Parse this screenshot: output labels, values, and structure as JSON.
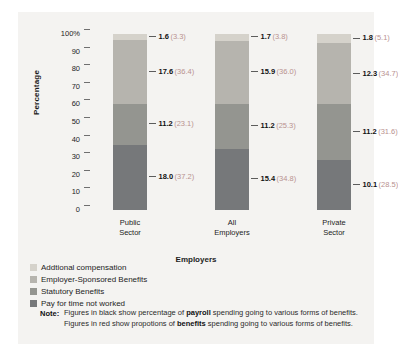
{
  "chart_data": {
    "type": "bar",
    "variant": "stacked-100",
    "title": "",
    "xlabel": "Employers",
    "ylabel": "Percentage",
    "ylim": [
      0,
      100
    ],
    "ytick_labels": [
      "100%",
      "90",
      "80",
      "70",
      "60",
      "50",
      "40",
      "30",
      "20",
      "10",
      "0"
    ],
    "ytick_values": [
      100,
      90,
      80,
      70,
      60,
      50,
      40,
      30,
      20,
      10,
      0
    ],
    "grid": false,
    "legend_position": "below-left",
    "categories": [
      "Public Sector",
      "All Employers",
      "Private Sector"
    ],
    "category_lines": [
      [
        "Public",
        "Sector"
      ],
      [
        "All",
        "Employers"
      ],
      [
        "Private",
        "Sector"
      ]
    ],
    "series": [
      {
        "name": "Addtional compensation",
        "color": "#d5d2cb",
        "values": [
          3.3,
          3.8,
          5.1
        ],
        "payroll_values": [
          1.6,
          1.7,
          1.8
        ]
      },
      {
        "name": "Employer-Sponsored Benefits",
        "color": "#b6b4ae",
        "values": [
          36.4,
          36.0,
          34.7
        ],
        "payroll_values": [
          17.6,
          15.9,
          12.3
        ]
      },
      {
        "name": "Statutory Benefits",
        "color": "#949590",
        "values": [
          23.1,
          25.3,
          31.6
        ],
        "payroll_values": [
          11.2,
          11.2,
          11.2
        ]
      },
      {
        "name": "Pay for time not worked",
        "color": "#76787a",
        "values": [
          37.2,
          34.8,
          28.5
        ],
        "payroll_values": [
          18.0,
          15.4,
          10.1
        ]
      }
    ],
    "bar_labels": [
      [
        {
          "black": "1.6",
          "red": "(3.3)"
        },
        {
          "black": "17.6",
          "red": "(36.4)"
        },
        {
          "black": "11.2",
          "red": "(23.1)"
        },
        {
          "black": "18.0",
          "red": "(37.2)"
        }
      ],
      [
        {
          "black": "1.7",
          "red": "(3.8)"
        },
        {
          "black": "15.9",
          "red": "(36.0)"
        },
        {
          "black": "11.2",
          "red": "(25.3)"
        },
        {
          "black": "15.4",
          "red": "(34.8)"
        }
      ],
      [
        {
          "black": "1.8",
          "red": "(5.1)"
        },
        {
          "black": "12.3",
          "red": "(34.7)"
        },
        {
          "black": "11.2",
          "red": "(31.6)"
        },
        {
          "black": "10.1",
          "red": "(28.5)"
        }
      ]
    ]
  },
  "legend": {
    "items": [
      {
        "label": "Addtional compensation",
        "color": "#d5d2cb"
      },
      {
        "label": "Employer-Sponsored Benefits",
        "color": "#b6b4ae"
      },
      {
        "label": "Statutory Benefits",
        "color": "#949590"
      },
      {
        "label": "Pay for time not worked",
        "color": "#76787a"
      }
    ]
  },
  "note": {
    "label": "Note:",
    "line1_pre": "Figures in black show percentage of ",
    "line1_bold": "payroll",
    "line1_post": " spending going to various forms of benefits.",
    "line2_pre": "Figures in red show propotions of ",
    "line2_bold": "benefits",
    "line2_post": " spending going to various forms of benefits."
  },
  "colors": {
    "panel_background": "#f4f3f1",
    "page_background": "#ffffff",
    "red_text": "#b9928f",
    "black_text": "#111111"
  }
}
